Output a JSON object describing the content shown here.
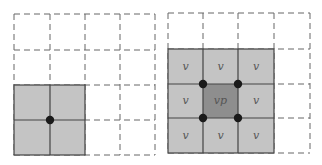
{
  "colors": {
    "background": "#ffffff",
    "dashed_line": "#666666",
    "solid_line": "#444444",
    "light_fill": "#c4c4c4",
    "dark_fill": "#8e8e8e",
    "dot": "#1a1a1a",
    "label": "#555555"
  },
  "left_panel": {
    "grid": {
      "rows": 4,
      "cols": 4,
      "x": [
        14,
        50,
        85,
        120,
        155
      ],
      "y": [
        14,
        50,
        85,
        120,
        155
      ]
    },
    "highlighted_block": {
      "col_start": 0,
      "row_start": 2,
      "cols": 2,
      "rows": 2
    },
    "dots": [
      {
        "col_line": 1,
        "row_line": 3
      }
    ]
  },
  "right_panel": {
    "grid": {
      "rows": 4,
      "cols": 4,
      "x": [
        168,
        203,
        238,
        274,
        310
      ],
      "y": [
        13,
        49,
        84,
        118,
        153
      ]
    },
    "highlighted_block": {
      "col_start": 0,
      "row_start": 1,
      "cols": 3,
      "rows": 3
    },
    "center_cell": {
      "col": 1,
      "row": 2
    },
    "labels": {
      "r1": [
        "v",
        "v",
        "v"
      ],
      "r2": [
        "v",
        "vp",
        "v"
      ],
      "r3": [
        "v",
        "v",
        "v"
      ]
    },
    "dots": [
      {
        "col_line": 1,
        "row_line": 2
      },
      {
        "col_line": 2,
        "row_line": 2
      },
      {
        "col_line": 1,
        "row_line": 3
      },
      {
        "col_line": 2,
        "row_line": 3
      }
    ]
  }
}
